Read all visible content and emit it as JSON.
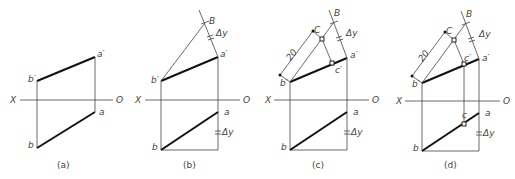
{
  "figure": {
    "axis_labels": {
      "left": "X",
      "right": "O"
    },
    "panels": [
      {
        "caption": "(a)",
        "labels": {
          "a_prime": "a′",
          "b_prime": "b′",
          "a": "a",
          "b": "b"
        }
      },
      {
        "caption": "(b)",
        "labels": {
          "a_prime": "a′",
          "b_prime": "b′",
          "a": "a",
          "b": "b",
          "B": "B",
          "dy_top": "Δy",
          "dy_bottom": "Δy"
        }
      },
      {
        "caption": "(c)",
        "labels": {
          "a_prime": "a′",
          "b_prime": "b′",
          "a": "a",
          "b": "b",
          "B": "B",
          "C": "C",
          "c_prime": "c′",
          "dim": "20",
          "dy_top": "Δy",
          "dy_bottom": "Δy"
        }
      },
      {
        "caption": "(d)",
        "labels": {
          "a_prime": "a′",
          "b_prime": "b′",
          "a": "a",
          "b": "b",
          "B": "B",
          "C": "C",
          "c_prime": "c′",
          "c": "c",
          "dim": "20",
          "dy_top": "Δy",
          "dy_bottom": "Δy"
        }
      }
    ]
  }
}
